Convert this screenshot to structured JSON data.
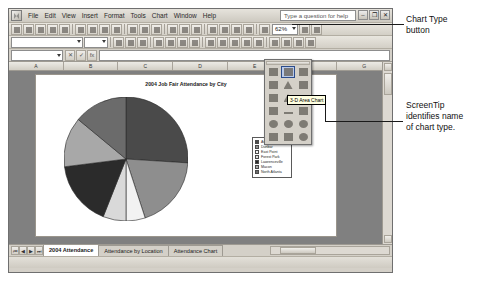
{
  "app": {
    "help_placeholder": "Type a question for help",
    "window_buttons": [
      "–",
      "❐",
      "✕"
    ]
  },
  "menu": {
    "items": [
      "File",
      "Edit",
      "View",
      "Insert",
      "Format",
      "Tools",
      "Chart",
      "Window",
      "Help"
    ]
  },
  "toolbar": {
    "zoom_value": "62%",
    "font_name": "",
    "font_size": "",
    "name_box": "",
    "formula_value": ""
  },
  "chart_type_menu": {
    "screentip": "3-D Area Chart",
    "selected_index": 1,
    "cells": [
      "column-chart-icon",
      "3d-area-chart-icon",
      "bar-chart-icon",
      "stacked-bar-icon",
      "cone-chart-icon",
      "cylinder-chart-icon",
      "histogram-icon",
      "pyramid-chart-icon",
      "line-chart-icon",
      "scatter-chart-icon",
      "radar-chart-icon",
      "stock-chart-icon",
      "pie-chart-icon",
      "doughnut-chart-icon",
      "bubble-chart-icon",
      "area-chart-icon",
      "surface-chart-icon",
      "3d-pie-icon"
    ]
  },
  "worksheet": {
    "column_headers": [
      "A",
      "B",
      "C",
      "D",
      "E",
      "F",
      "G"
    ],
    "tabs": [
      {
        "label": "2004 Attendance",
        "active": true
      },
      {
        "label": "Attendance by Location",
        "active": false
      },
      {
        "label": "Attendance Chart",
        "active": false
      }
    ],
    "tab_nav": [
      "⏮",
      "◀",
      "▶",
      "⏭"
    ],
    "status_text": ""
  },
  "chart_data": {
    "type": "pie",
    "title": "2004 Job Fair Attendance by City",
    "xlabel": "",
    "ylabel": "",
    "legend_position": "right",
    "categories": [
      "Atlanta",
      "Dunbar",
      "East Point",
      "Forest Park",
      "Lawrenceville",
      "Macon",
      "North Atlanta"
    ],
    "values": [
      26,
      19,
      5,
      6,
      17,
      13,
      14
    ],
    "colors": [
      "#4a4a4a",
      "#8e8e8e",
      "#f2f2f2",
      "#d9d9d9",
      "#2b2b2b",
      "#a8a8a8",
      "#6b6b6b"
    ]
  },
  "annotations": {
    "chart_type_button": "Chart Type\nbutton",
    "chart_type_button_line1": "Chart Type",
    "chart_type_button_line2": "button",
    "screentip_note_line1": "ScreenTip",
    "screentip_note_line2": "identifies name",
    "screentip_note_line3": "of chart type."
  }
}
